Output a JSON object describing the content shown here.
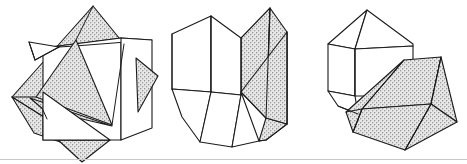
{
  "plate": {
    "title": "Crystal twinning line drawings",
    "description": "Three black-and-white line-art diagrams of twinned crystal forms, each drawn in perspective with some faces left white and others filled with a gray stipple texture.",
    "background_color": "#ffffff",
    "line_color": "#1b1b1b",
    "stipple_color": "#a8a8a8",
    "baseline_color": "#c9c9c9",
    "figure_count": 3
  },
  "figures": [
    {
      "id": "fig-a",
      "label": "a",
      "name": "interpenetrant-twin",
      "caption": "Interpenetrant twin: two cubes interpenetrating at an angle",
      "shaded_face_count": 6,
      "light_face_count": 4
    },
    {
      "id": "fig-b",
      "label": "b",
      "name": "contact-twin-prism",
      "caption": "Contact twin: two prismatic crystals joined along a composition plane",
      "shaded_face_count": 3,
      "light_face_count": 5
    },
    {
      "id": "fig-c",
      "label": "c",
      "name": "penetration-twin-block",
      "caption": "Penetration twin: a blocky crystal with a large shaded wedge crossing it",
      "shaded_face_count": 4,
      "light_face_count": 5
    }
  ],
  "baseline": {
    "name": "plate-baseline-rule",
    "visible": true
  }
}
